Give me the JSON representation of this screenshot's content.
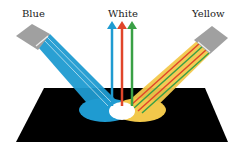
{
  "labels": {
    "blue": "Blue",
    "white": "White",
    "yellow": "Yellow"
  },
  "colors": {
    "blue": "#1f9bd1",
    "red": "#e0462a",
    "green": "#3aa046",
    "yellow": "#f2c84b",
    "surface": "#000000",
    "lamp": "#a0a0a0"
  }
}
